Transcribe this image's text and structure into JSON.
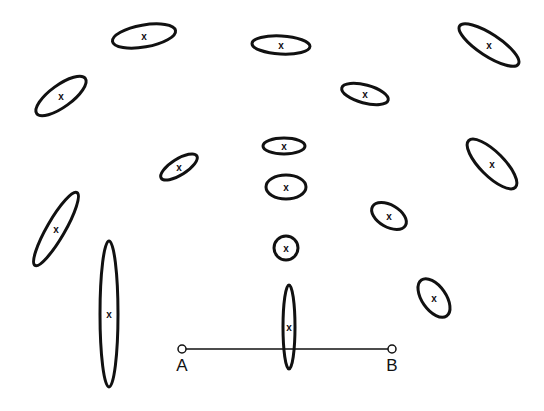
{
  "diagram": {
    "center_marker": "x",
    "stroke_color": "#111111",
    "background_color": "#ffffff",
    "ellipses": [
      {
        "cx": 144,
        "cy": 36,
        "rx": 32,
        "ry": 11,
        "angle": -10
      },
      {
        "cx": 281,
        "cy": 45,
        "rx": 29,
        "ry": 9,
        "angle": 3
      },
      {
        "cx": 489,
        "cy": 45,
        "rx": 35,
        "ry": 11,
        "angle": 33
      },
      {
        "cx": 61,
        "cy": 96,
        "rx": 30,
        "ry": 11,
        "angle": -36
      },
      {
        "cx": 365,
        "cy": 94,
        "rx": 24,
        "ry": 9,
        "angle": 15
      },
      {
        "cx": 284,
        "cy": 146,
        "rx": 21,
        "ry": 8,
        "angle": 0
      },
      {
        "cx": 179,
        "cy": 167,
        "rx": 21,
        "ry": 8,
        "angle": -32
      },
      {
        "cx": 492,
        "cy": 164,
        "rx": 33,
        "ry": 12,
        "angle": 45
      },
      {
        "cx": 286,
        "cy": 187,
        "rx": 20,
        "ry": 12,
        "angle": 0
      },
      {
        "cx": 56,
        "cy": 229,
        "rx": 42,
        "ry": 9,
        "angle": -60
      },
      {
        "cx": 389,
        "cy": 216,
        "rx": 19,
        "ry": 11,
        "angle": 30
      },
      {
        "cx": 286,
        "cy": 248,
        "rx": 12,
        "ry": 12,
        "angle": 0
      },
      {
        "cx": 109,
        "cy": 314,
        "rx": 9,
        "ry": 73,
        "angle": 0
      },
      {
        "cx": 434,
        "cy": 298,
        "rx": 22,
        "ry": 12,
        "angle": 55
      },
      {
        "cx": 289,
        "cy": 327,
        "rx": 6,
        "ry": 42,
        "angle": 0
      }
    ],
    "baseline": {
      "start": {
        "label": "A",
        "x": 182,
        "y": 349
      },
      "end": {
        "label": "B",
        "x": 392,
        "y": 349
      }
    }
  }
}
